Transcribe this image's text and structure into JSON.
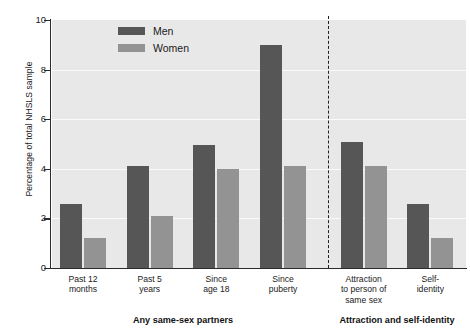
{
  "chart_data": {
    "type": "bar",
    "title": "",
    "xlabel": "",
    "ylabel": "Percentage of total NHSLS sample",
    "ylim": [
      0,
      10
    ],
    "yticks": [
      0,
      2,
      4,
      6,
      8,
      10
    ],
    "grid": true,
    "legend_position": "top-center",
    "categories": [
      "Past 12 months",
      "Past 5 years",
      "Since age 18",
      "Since puberty",
      "Attraction to person of same sex",
      "Self-identity"
    ],
    "category_lines": [
      [
        "Past 12",
        "months"
      ],
      [
        "Past 5",
        "years"
      ],
      [
        "Since",
        "age 18"
      ],
      [
        "Since",
        "puberty"
      ],
      [
        "Attraction",
        "to person of",
        "same sex"
      ],
      [
        "Self-",
        "identity"
      ]
    ],
    "series": [
      {
        "name": "Men",
        "color": "#565656",
        "values": [
          2.6,
          4.1,
          4.95,
          9.0,
          5.1,
          2.6
        ]
      },
      {
        "name": "Women",
        "color": "#939393",
        "values": [
          1.2,
          2.1,
          4.0,
          4.1,
          4.1,
          1.2
        ]
      }
    ],
    "sections": [
      {
        "label": "Any same-sex partners",
        "categories": 4
      },
      {
        "label": "Attraction and self-identity",
        "categories": 2
      }
    ],
    "divider": {
      "style": "dashed",
      "after_category": 4
    }
  },
  "colors": {
    "men": "#565656",
    "women": "#939393",
    "plot_background": "#e8e8e8",
    "gridline": "#fafafa",
    "axis": "#2b2b2b",
    "text": "#1a1a1a"
  }
}
